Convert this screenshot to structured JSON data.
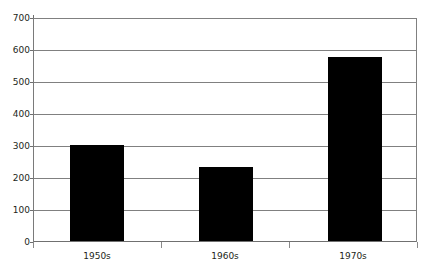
{
  "chart_data": {
    "type": "bar",
    "title": "",
    "subtitle": "",
    "xlabel": "",
    "ylabel": "",
    "categories": [
      "1950s",
      "1960s",
      "1970s"
    ],
    "values": [
      303,
      232,
      580
    ],
    "series": [
      {
        "name": "",
        "values": [
          303,
          232,
          580
        ]
      }
    ],
    "ylim": [
      0,
      700
    ],
    "y_ticks": [
      0,
      100,
      200,
      300,
      400,
      500,
      600,
      700
    ],
    "y_tick_labels": [
      "0",
      "100",
      "200",
      "300",
      "400",
      "500",
      "600",
      "700"
    ],
    "grid": true,
    "grid_axis": "y",
    "legend": false,
    "legend_position": "none",
    "bar_color": "#000000",
    "grid_color": "#808080",
    "axis_color": "#6e6e6e",
    "text_color": "#231f20",
    "background": "#ffffff",
    "annotations": []
  }
}
